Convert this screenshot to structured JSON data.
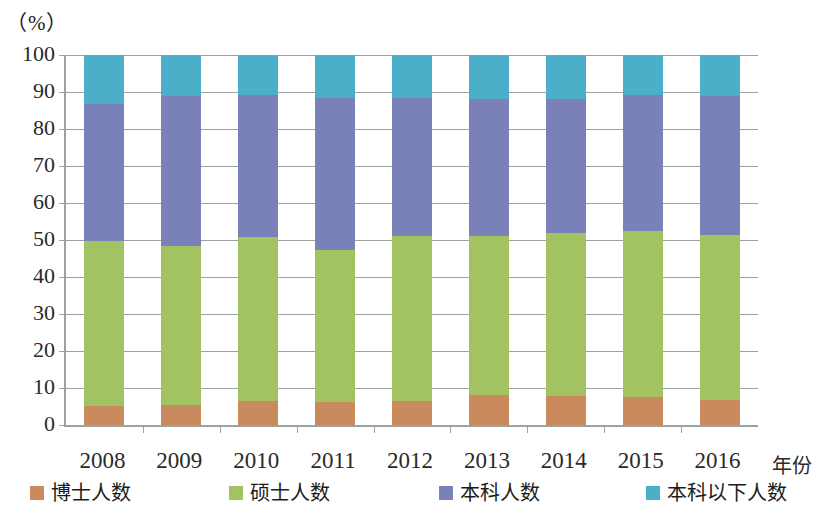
{
  "axis": {
    "y_unit_label": "（%）",
    "x_axis_title": "年份",
    "y_ticks": [
      "0",
      "10",
      "20",
      "30",
      "40",
      "50",
      "60",
      "70",
      "80",
      "90",
      "100"
    ]
  },
  "legend": {
    "items": [
      {
        "label": "博士人数",
        "color": "#C98A5E"
      },
      {
        "label": "硕士人数",
        "color": "#A3C262"
      },
      {
        "label": "本科人数",
        "color": "#7A80B8"
      },
      {
        "label": "本科以下人数",
        "color": "#4BAFC9"
      }
    ]
  },
  "chart_data": {
    "type": "bar",
    "stacked": true,
    "stack_total": 100,
    "title": "",
    "xlabel": "年份",
    "ylabel": "（%）",
    "ylim": [
      0,
      100
    ],
    "ytick_step": 10,
    "grid": true,
    "legend_position": "bottom",
    "categories": [
      "2008",
      "2009",
      "2010",
      "2011",
      "2012",
      "2013",
      "2014",
      "2015",
      "2016"
    ],
    "series": [
      {
        "name": "博士人数",
        "color": "#C98A5E",
        "values": [
          5.2,
          5.5,
          6.5,
          6.2,
          6.6,
          8.0,
          7.8,
          7.5,
          6.8
        ]
      },
      {
        "name": "硕士人数",
        "color": "#A3C262",
        "values": [
          44.6,
          43.0,
          44.3,
          41.0,
          44.4,
          43.2,
          44.2,
          45.0,
          44.5
        ]
      },
      {
        "name": "本科人数",
        "color": "#7A80B8",
        "values": [
          37.0,
          40.3,
          38.4,
          41.3,
          37.4,
          37.0,
          36.0,
          36.8,
          37.5
        ]
      },
      {
        "name": "本科以下人数",
        "color": "#4BAFC9",
        "values": [
          13.2,
          11.2,
          10.8,
          11.5,
          11.6,
          11.8,
          12.0,
          10.7,
          11.2
        ]
      }
    ],
    "cumulative_tops": {
      "博士人数": [
        5.2,
        5.5,
        6.5,
        6.2,
        6.6,
        8.0,
        7.8,
        7.5,
        6.8
      ],
      "硕士人数": [
        49.8,
        48.5,
        50.8,
        47.2,
        51.0,
        51.2,
        52.0,
        52.5,
        51.3
      ],
      "本科人数": [
        86.8,
        88.8,
        89.2,
        88.5,
        88.4,
        88.2,
        88.0,
        89.3,
        88.8
      ],
      "本科以下人数": [
        100,
        100,
        100,
        100,
        100,
        100,
        100,
        100,
        100
      ]
    }
  }
}
